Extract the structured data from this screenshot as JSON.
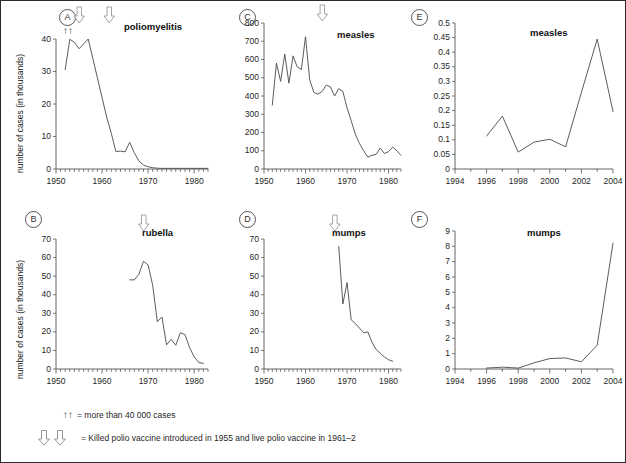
{
  "figure": {
    "y_axis_label": "number of cases (in thousands)",
    "footnotes": [
      {
        "marker": "up-up",
        "text": "= more than 40 000 cases"
      },
      {
        "marker": "down-down",
        "text": "= Killed polio vaccine introduced in 1955 and live polio vaccine in 1961–2"
      }
    ]
  },
  "chart_data": [
    {
      "panel": "A",
      "type": "line",
      "title": "poliomyelitis",
      "xlabel": "",
      "ylabel": "number of cases (in thousands)",
      "xlim": [
        1950,
        1983
      ],
      "ylim": [
        0,
        40
      ],
      "yticks": [
        0,
        10,
        20,
        30,
        40
      ],
      "xticks": [
        1950,
        1960,
        1970,
        1980
      ],
      "grid": false,
      "annotations": [
        {
          "symbol": "↑↑",
          "label": "more than 40 000 cases",
          "x": 1953
        },
        {
          "symbol": "⇩",
          "label": "killed polio vaccine 1955",
          "x": 1955
        },
        {
          "symbol": "⇩",
          "label": "live polio vaccine 1961-2",
          "x": 1961.5
        }
      ],
      "x": [
        1952,
        1953,
        1954,
        1955,
        1956,
        1957,
        1958,
        1959,
        1960,
        1961,
        1962,
        1963,
        1964,
        1965,
        1966,
        1967,
        1968,
        1969,
        1970,
        1971,
        1972,
        1973,
        1974,
        1975,
        1976,
        1977,
        1978,
        1979,
        1980,
        1981,
        1982,
        1983
      ],
      "values": [
        30.6,
        39.9,
        39.0,
        37.0,
        38.5,
        40.0,
        34.0,
        28.0,
        22.0,
        16.0,
        11.0,
        5.4,
        5.5,
        5.3,
        8.2,
        5.0,
        2.5,
        1.2,
        0.7,
        0.4,
        0.25,
        0.2,
        0.2,
        0.2,
        0.2,
        0.2,
        0.2,
        0.2,
        0.2,
        0.2,
        0.2,
        0.2
      ]
    },
    {
      "panel": "B",
      "type": "line",
      "title": "rubella",
      "xlabel": "",
      "ylabel": "number of cases (in thousands)",
      "xlim": [
        1950,
        1983
      ],
      "ylim": [
        0,
        70
      ],
      "yticks": [
        0,
        10,
        20,
        30,
        40,
        50,
        60,
        70
      ],
      "xticks": [
        1950,
        1960,
        1970,
        1980
      ],
      "grid": false,
      "annotations": [
        {
          "symbol": "⇩",
          "label": "rubella vaccine introduced",
          "x": 1969
        }
      ],
      "x": [
        1966,
        1967,
        1968,
        1969,
        1970,
        1971,
        1972,
        1973,
        1974,
        1975,
        1976,
        1977,
        1978,
        1979,
        1980,
        1981,
        1982
      ],
      "values": [
        48.0,
        48.0,
        51.0,
        58.0,
        56.0,
        45.0,
        25.5,
        28.0,
        13.0,
        16.0,
        12.8,
        19.5,
        18.5,
        11.5,
        6.5,
        3.5,
        3.0
      ]
    },
    {
      "panel": "C",
      "type": "line",
      "title": "measles",
      "xlabel": "",
      "ylabel": "number of cases (in thousands)",
      "xlim": [
        1950,
        1983
      ],
      "ylim": [
        0,
        800
      ],
      "yticks": [
        0,
        100,
        200,
        300,
        400,
        500,
        600,
        700,
        800
      ],
      "xticks": [
        1950,
        1960,
        1970,
        1980
      ],
      "grid": false,
      "annotations": [
        {
          "symbol": "⇩",
          "label": "measles vaccine introduced",
          "x": 1964
        }
      ],
      "x": [
        1952,
        1953,
        1954,
        1955,
        1956,
        1957,
        1958,
        1959,
        1960,
        1961,
        1962,
        1963,
        1964,
        1965,
        1966,
        1967,
        1968,
        1969,
        1970,
        1971,
        1972,
        1973,
        1974,
        1975,
        1976,
        1977,
        1978,
        1979,
        1980,
        1981,
        1982,
        1983
      ],
      "values": [
        350,
        580,
        480,
        630,
        470,
        620,
        560,
        545,
        725,
        490,
        420,
        410,
        425,
        460,
        450,
        400,
        440,
        425,
        335,
        265,
        190,
        140,
        100,
        65,
        75,
        80,
        115,
        85,
        95,
        120,
        100,
        75
      ]
    },
    {
      "panel": "D",
      "type": "line",
      "title": "mumps",
      "xlabel": "",
      "ylabel": "number of cases (in thousands)",
      "xlim": [
        1950,
        1983
      ],
      "ylim": [
        0,
        70
      ],
      "yticks": [
        0,
        10,
        20,
        30,
        40,
        50,
        60,
        70
      ],
      "xticks": [
        1950,
        1960,
        1970,
        1980
      ],
      "grid": false,
      "annotations": [
        {
          "symbol": "⇩",
          "label": "mumps vaccine introduced",
          "x": 1967
        }
      ],
      "x": [
        1968,
        1969,
        1970,
        1971,
        1972,
        1973,
        1974,
        1975,
        1976,
        1977,
        1978,
        1979,
        1980,
        1981
      ],
      "values": [
        66.0,
        35.0,
        46.5,
        26.5,
        24.5,
        22.0,
        19.5,
        20.0,
        14.5,
        10.5,
        8.5,
        6.5,
        5.0,
        4.2
      ]
    },
    {
      "panel": "E",
      "type": "line",
      "title": "measles",
      "xlabel": "",
      "ylabel": "",
      "xlim": [
        1994,
        2004
      ],
      "ylim": [
        0,
        0.5
      ],
      "yticks": [
        0,
        0.05,
        0.1,
        0.15,
        0.2,
        0.25,
        0.3,
        0.35,
        0.4,
        0.45,
        0.5
      ],
      "xticks": [
        1994,
        1996,
        1998,
        2000,
        2002,
        2004
      ],
      "grid": false,
      "x": [
        1996,
        1997,
        1998,
        1999,
        2000,
        2001,
        2002,
        2003,
        2004
      ],
      "values": [
        0.113,
        0.181,
        0.058,
        0.092,
        0.102,
        0.076,
        0.262,
        0.445,
        0.197
      ]
    },
    {
      "panel": "F",
      "type": "line",
      "title": "mumps",
      "xlabel": "",
      "ylabel": "",
      "xlim": [
        1994,
        2004
      ],
      "ylim": [
        0,
        9
      ],
      "yticks": [
        0,
        1,
        2,
        3,
        4,
        5,
        6,
        7,
        8,
        9
      ],
      "xticks": [
        1994,
        1996,
        1998,
        2000,
        2002,
        2004
      ],
      "grid": false,
      "x": [
        1996,
        1997,
        1998,
        1999,
        2000,
        2001,
        2002,
        2003,
        2004
      ],
      "values": [
        0.06,
        0.12,
        0.06,
        0.4,
        0.68,
        0.72,
        0.47,
        1.55,
        8.2
      ]
    }
  ]
}
